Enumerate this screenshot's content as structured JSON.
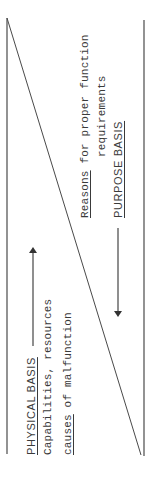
{
  "diagram": {
    "type": "triangle-split-abstraction-diagram",
    "left_region": {
      "heading": "PHYSICAL BASIS",
      "line1_pre": "Capabilities, resources",
      "line2_underlined": "causes",
      "line2_rest": " of malfunction",
      "arrow_direction": "up"
    },
    "right_region": {
      "line1_underlined": "Reasons",
      "line1_rest": " for proper function",
      "line2": "requirements",
      "heading": "PURPOSE BASIS",
      "arrow_direction": "down"
    },
    "colors": {
      "line": "#4a4a4a",
      "text": "#3a3a3a",
      "background": "#ffffff"
    }
  }
}
